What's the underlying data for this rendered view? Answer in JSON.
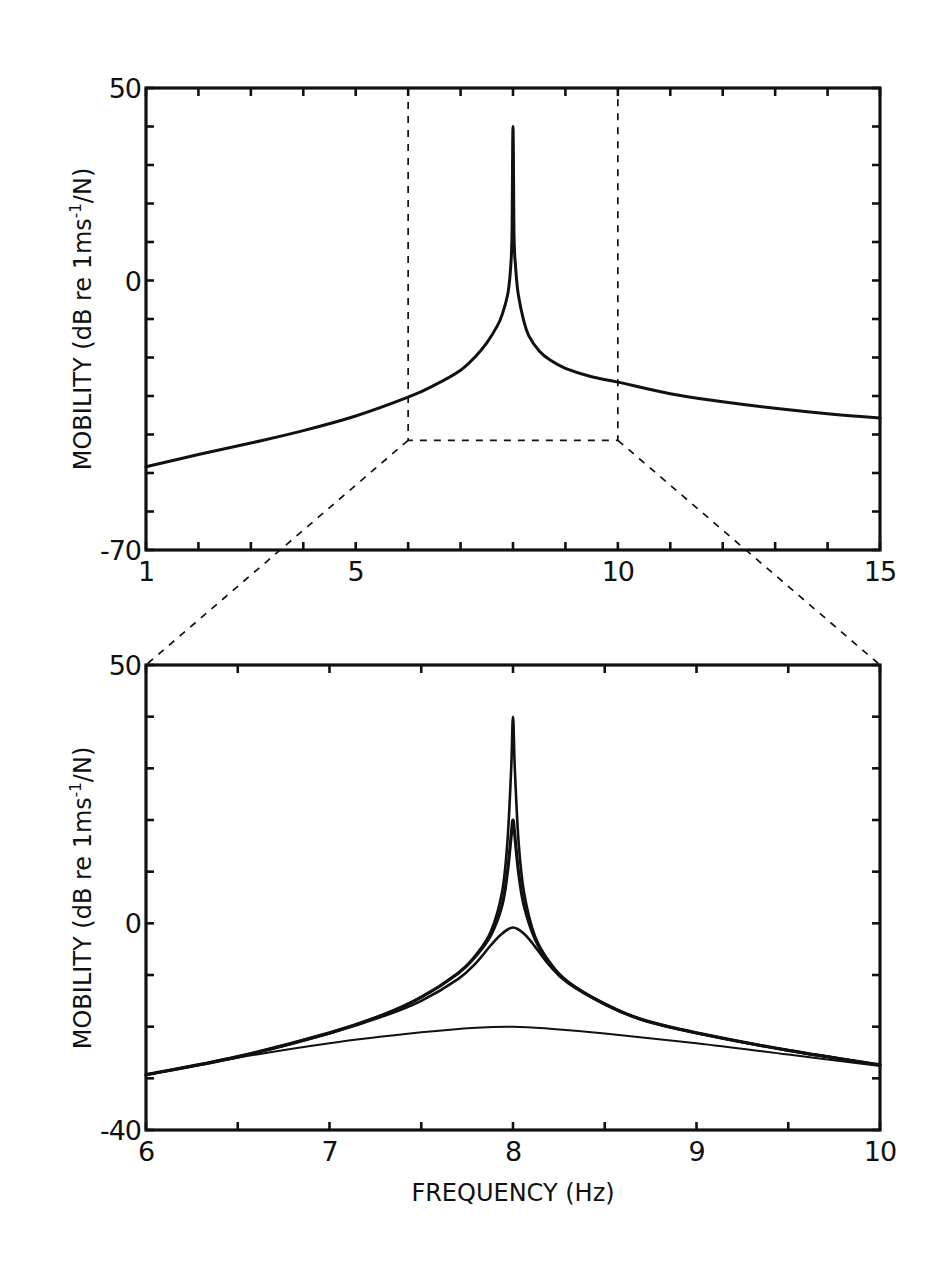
{
  "figure": {
    "ylabel_prefix": "MOBILITY (dB re 1ms",
    "ylabel_sup": "-1",
    "ylabel_suffix": "/N)",
    "xlabel": "FREQUENCY (Hz)"
  },
  "chart_data": [
    {
      "id": "top",
      "type": "line",
      "title": "",
      "xlabel": "",
      "ylabel": "MOBILITY (dB re 1ms^-1/N)",
      "xlim": [
        1,
        15
      ],
      "ylim": [
        -70,
        50
      ],
      "grid": false,
      "legend": null,
      "x_tick_labels": [
        {
          "value": 1,
          "label": "1"
        },
        {
          "value": 5,
          "label": "5"
        },
        {
          "value": 10,
          "label": "10"
        },
        {
          "value": 15,
          "label": "15"
        }
      ],
      "x_minor_step": 1,
      "y_tick_labels": [
        {
          "value": 50,
          "label": "50"
        },
        {
          "value": 0,
          "label": "0"
        },
        {
          "value": -70,
          "label": "-70"
        }
      ],
      "y_minor_step": 10,
      "series": [
        {
          "name": "mobility",
          "stroke_width": 3,
          "x": [
            1,
            2,
            3,
            4,
            5,
            6,
            6.5,
            7,
            7.3,
            7.5,
            7.7,
            7.8,
            7.9,
            7.95,
            7.98,
            8.0,
            8.02,
            8.05,
            8.1,
            8.2,
            8.3,
            8.5,
            8.7,
            9,
            9.5,
            10,
            11,
            12,
            13,
            14,
            15
          ],
          "y": [
            -48.4,
            -45.2,
            -42.2,
            -39.0,
            -35.2,
            -30.3,
            -27.2,
            -23.3,
            -19.5,
            -16.2,
            -11.8,
            -8.6,
            -3.5,
            2.5,
            12,
            40,
            12,
            3.5,
            -3.5,
            -10.2,
            -14.3,
            -18.3,
            -20.6,
            -22.8,
            -25.0,
            -26.4,
            -29.4,
            -31.5,
            -33.2,
            -34.6,
            -35.7
          ]
        }
      ],
      "annotations": [
        {
          "type": "dashed-rect",
          "x0": 6,
          "x1": 10,
          "y0": -41.5,
          "y1": 50,
          "note": "zoom region projected onto lower plot"
        }
      ]
    },
    {
      "id": "bottom",
      "type": "line",
      "title": "",
      "xlabel": "FREQUENCY (Hz)",
      "ylabel": "MOBILITY (dB re 1ms^-1/N)",
      "xlim": [
        6,
        10
      ],
      "ylim": [
        -40,
        50
      ],
      "grid": false,
      "legend": null,
      "x_tick_labels": [
        {
          "value": 6,
          "label": "6"
        },
        {
          "value": 7,
          "label": "7"
        },
        {
          "value": 8,
          "label": "8"
        },
        {
          "value": 9,
          "label": "9"
        },
        {
          "value": 10,
          "label": "10"
        }
      ],
      "x_minor_step": 0.5,
      "y_tick_labels": [
        {
          "value": 50,
          "label": "50"
        },
        {
          "value": 0,
          "label": "0"
        },
        {
          "value": -40,
          "label": "-40"
        }
      ],
      "y_minor_step": 10,
      "series": [
        {
          "name": "peak ~40 dB (lightest damping)",
          "stroke_width": 2.6,
          "x": [
            6,
            6.5,
            7,
            7.3,
            7.5,
            7.7,
            7.8,
            7.88,
            7.94,
            7.97,
            7.99,
            8.0,
            8.01,
            8.03,
            8.06,
            8.12,
            8.2,
            8.3,
            8.5,
            8.7,
            9,
            9.5,
            10
          ],
          "y": [
            -29.3,
            -25.8,
            -21.2,
            -17.6,
            -14.3,
            -9.6,
            -6.0,
            -1.5,
            6,
            16,
            30,
            40,
            30,
            16,
            6,
            -2.5,
            -7.5,
            -11.3,
            -15.6,
            -18.6,
            -21.2,
            -24.6,
            -27.4
          ]
        },
        {
          "name": "peak ~20 dB",
          "stroke_width": 3.2,
          "x": [
            6,
            6.5,
            7,
            7.3,
            7.5,
            7.7,
            7.8,
            7.88,
            7.94,
            7.97,
            7.99,
            8.0,
            8.01,
            8.03,
            8.06,
            8.12,
            8.2,
            8.3,
            8.5,
            8.7,
            9,
            9.5,
            10
          ],
          "y": [
            -29.3,
            -25.8,
            -21.2,
            -17.6,
            -14.3,
            -9.7,
            -6.2,
            -2.2,
            3.5,
            10,
            17,
            20,
            17,
            10,
            3.5,
            -3,
            -7.7,
            -11.4,
            -15.6,
            -18.6,
            -21.2,
            -24.6,
            -27.4
          ]
        },
        {
          "name": "peak ~0 dB",
          "stroke_width": 2.6,
          "x": [
            6,
            6.5,
            7,
            7.3,
            7.5,
            7.7,
            7.8,
            7.88,
            7.94,
            8.0,
            8.06,
            8.12,
            8.2,
            8.3,
            8.5,
            8.7,
            9,
            9.5,
            10
          ],
          "y": [
            -29.3,
            -25.9,
            -21.3,
            -17.9,
            -15.0,
            -10.8,
            -7.6,
            -4.2,
            -2.0,
            -0.8,
            -2.0,
            -4.5,
            -8.2,
            -11.6,
            -15.7,
            -18.6,
            -21.2,
            -24.6,
            -27.4
          ]
        },
        {
          "name": "flat ~-20 dB (heaviest damping)",
          "stroke_width": 2,
          "x": [
            6,
            6.5,
            7,
            7.5,
            7.8,
            8.0,
            8.2,
            8.5,
            9,
            9.5,
            10
          ],
          "y": [
            -29.3,
            -26.0,
            -23.2,
            -21.1,
            -20.2,
            -20.0,
            -20.4,
            -21.3,
            -23.2,
            -25.4,
            -27.6
          ]
        }
      ]
    }
  ]
}
